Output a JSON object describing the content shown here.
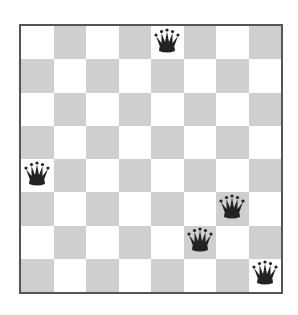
{
  "board": {
    "size": 8,
    "colors": {
      "light": "#ffffff",
      "dark": "#cfcfcf",
      "piece": "#222222"
    },
    "top_left_square": "light",
    "queens": [
      {
        "row": 0,
        "col": 4
      },
      {
        "row": 4,
        "col": 0
      },
      {
        "row": 5,
        "col": 6
      },
      {
        "row": 6,
        "col": 5
      },
      {
        "row": 7,
        "col": 7
      }
    ],
    "queen_icon": "queen-icon"
  }
}
